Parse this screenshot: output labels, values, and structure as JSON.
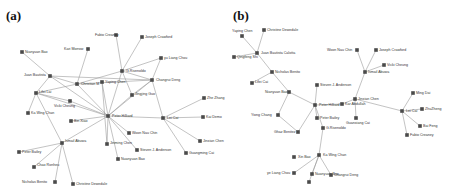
{
  "panels": [
    {
      "id": "a",
      "label": "(a)",
      "nodes": [
        {
          "id": "Fabio Creaney",
          "x": 116,
          "y": 35,
          "lx": -21,
          "ly": 1
        },
        {
          "id": "Joseph Crawford",
          "x": 142,
          "y": 37,
          "lx": 3,
          "ly": 1
        },
        {
          "id": "Kari Morrow",
          "x": 88,
          "y": 49,
          "lx": -24,
          "ly": 1
        },
        {
          "id": "Nianyuan Bao",
          "x": 22,
          "y": 52,
          "lx": 3,
          "ly": 1
        },
        {
          "id": "yu Liang Chou",
          "x": 161,
          "y": 58,
          "lx": 3,
          "ly": 1
        },
        {
          "id": "G.Rivenoldo",
          "x": 122,
          "y": 71,
          "lx": 4,
          "ly": 1
        },
        {
          "id": "Juan Bautista",
          "x": 50,
          "y": 76,
          "lx": -26,
          "ly": 0
        },
        {
          "id": "Christian M",
          "x": 77,
          "y": 84,
          "lx": 4,
          "ly": 1
        },
        {
          "id": "Yaping Chen",
          "x": 102,
          "y": 82,
          "lx": 3,
          "ly": 1
        },
        {
          "id": "Changrui Deng",
          "x": 152,
          "y": 80,
          "lx": 4,
          "ly": 1
        },
        {
          "id": "Lifei Lai",
          "x": 36,
          "y": 93,
          "lx": 3,
          "ly": 0
        },
        {
          "id": "Jingjing Guo",
          "x": 132,
          "y": 95,
          "lx": 3,
          "ly": 0
        },
        {
          "id": "Vicki Cheung",
          "x": 70,
          "y": 101,
          "lx": -16,
          "ly": 6
        },
        {
          "id": "Zhe Zhang",
          "x": 204,
          "y": 98,
          "lx": 3,
          "ly": 1
        },
        {
          "id": "Ka Wing Chan",
          "x": 28,
          "y": 113,
          "lx": 3,
          "ly": 1
        },
        {
          "id": "Bin Xiao",
          "x": 71,
          "y": 121,
          "lx": 3,
          "ly": 1
        },
        {
          "id": "Peter Hilliard",
          "x": 108,
          "y": 116,
          "lx": 4,
          "ly": 1
        },
        {
          "id": "Lei Cai",
          "x": 163,
          "y": 118,
          "lx": 4,
          "ly": 1
        },
        {
          "id": "Kai Demo",
          "x": 203,
          "y": 117,
          "lx": 3,
          "ly": 1
        },
        {
          "id": "Woon Nau Chin",
          "x": 129,
          "y": 133,
          "lx": 3,
          "ly": 1
        },
        {
          "id": "Jinming Chen",
          "x": 107,
          "y": 144,
          "lx": 3,
          "ly": 0
        },
        {
          "id": "Ismail Abuwa",
          "x": 62,
          "y": 143,
          "lx": 3,
          "ly": -1
        },
        {
          "id": "Jinxian Chen",
          "x": 200,
          "y": 141,
          "lx": 3,
          "ly": 1
        },
        {
          "id": "Steven J. Anderson",
          "x": 137,
          "y": 150,
          "lx": 3,
          "ly": 1
        },
        {
          "id": "Peter Bailey",
          "x": 19,
          "y": 152,
          "lx": 3,
          "ly": 1
        },
        {
          "id": "Guangming Cai",
          "x": 186,
          "y": 153,
          "lx": 3,
          "ly": 1
        },
        {
          "id": "Nuanyuan Bao",
          "x": 118,
          "y": 159,
          "lx": 3,
          "ly": 1
        },
        {
          "id": "Chao Ronheu",
          "x": 34,
          "y": 167,
          "lx": 3,
          "ly": -1
        },
        {
          "id": "Nicholas Benito",
          "x": 55,
          "y": 182,
          "lx": -33,
          "ly": 1
        },
        {
          "id": "Christine Dewedale",
          "x": 73,
          "y": 184,
          "lx": 3,
          "ly": 1
        }
      ],
      "edges": [
        [
          "Fabio Creaney",
          "G.Rivenoldo"
        ],
        [
          "Joseph Crawford",
          "G.Rivenoldo"
        ],
        [
          "yu Liang Chou",
          "G.Rivenoldo"
        ],
        [
          "yu Liang Chou",
          "Changrui Deng"
        ],
        [
          "G.Rivenoldo",
          "Changrui Deng"
        ],
        [
          "G.Rivenoldo",
          "Christian M"
        ],
        [
          "G.Rivenoldo",
          "Peter Hilliard"
        ],
        [
          "G.Rivenoldo",
          "Jingjing Guo"
        ],
        [
          "Kari Morrow",
          "Christian M"
        ],
        [
          "Nianyuan Bao",
          "Juan Bautista"
        ],
        [
          "Juan Bautista",
          "Changrui Deng"
        ],
        [
          "Juan Bautista",
          "Christian M"
        ],
        [
          "Juan Bautista",
          "Lifei Lai"
        ],
        [
          "Juan Bautista",
          "Peter Hilliard"
        ],
        [
          "Christian M",
          "Lifei Lai"
        ],
        [
          "Christian M",
          "Peter Hilliard"
        ],
        [
          "Christian M",
          "Changrui Deng"
        ],
        [
          "Yaping Chen",
          "Peter Hilliard"
        ],
        [
          "Yaping Chen",
          "Jinming Chen"
        ],
        [
          "Changrui Deng",
          "Jingjing Guo"
        ],
        [
          "Changrui Deng",
          "Peter Hilliard"
        ],
        [
          "Changrui Deng",
          "Lei Cai"
        ],
        [
          "Lifei Lai",
          "Vicki Cheung"
        ],
        [
          "Lifei Lai",
          "Ka Wing Chan"
        ],
        [
          "Lifei Lai",
          "Peter Hilliard"
        ],
        [
          "Lifei Lai",
          "Ismail Abuwa"
        ],
        [
          "Vicki Cheung",
          "Peter Hilliard"
        ],
        [
          "Bin Xiao",
          "Peter Hilliard"
        ],
        [
          "Jingjing Guo",
          "Peter Hilliard"
        ],
        [
          "Peter Hilliard",
          "Lei Cai"
        ],
        [
          "Peter Hilliard",
          "Woon Nau Chin"
        ],
        [
          "Peter Hilliard",
          "Jinming Chen"
        ],
        [
          "Peter Hilliard",
          "Steven J. Anderson"
        ],
        [
          "Peter Hilliard",
          "Nuanyuan Bao"
        ],
        [
          "Peter Hilliard",
          "Ismail Abuwa"
        ],
        [
          "Lei Cai",
          "Zhe Zhang"
        ],
        [
          "Lei Cai",
          "Kai Demo"
        ],
        [
          "Lei Cai",
          "Jinxian Chen"
        ],
        [
          "Lei Cai",
          "Guangming Cai"
        ],
        [
          "Ismail Abuwa",
          "Peter Bailey"
        ],
        [
          "Ismail Abuwa",
          "Chao Ronheu"
        ],
        [
          "Ismail Abuwa",
          "Nicholas Benito"
        ],
        [
          "Ismail Abuwa",
          "Christine Dewedale"
        ]
      ]
    },
    {
      "id": "b",
      "label": "(b)",
      "nodes": [
        {
          "id": "Yaping Chen",
          "x": 10,
          "y": 36,
          "lx": -10,
          "ly": -4
        },
        {
          "id": "Christine Dewedale",
          "x": 32,
          "y": 30,
          "lx": 3,
          "ly": 1
        },
        {
          "id": "Juan Bautista Calotta",
          "x": 25,
          "y": 53,
          "lx": 4,
          "ly": 1
        },
        {
          "id": "Qingfeng Shi",
          "x": 2,
          "y": 57,
          "lx": 3,
          "ly": 1
        },
        {
          "id": "Nicholas Benito",
          "x": 40,
          "y": 72,
          "lx": 3,
          "ly": 1
        },
        {
          "id": "Lifei Cai",
          "x": 20,
          "y": 83,
          "lx": 3,
          "ly": 0
        },
        {
          "id": "Nianyuan Bao",
          "x": 57,
          "y": 92,
          "lx": -24,
          "ly": 1
        },
        {
          "id": "Steven J. Anderson",
          "x": 85,
          "y": 85,
          "lx": 3,
          "ly": 1
        },
        {
          "id": "Peter Hilliard",
          "x": 83,
          "y": 105,
          "lx": 4,
          "ly": 1
        },
        {
          "id": "Kar Abdullah",
          "x": 110,
          "y": 104,
          "lx": 3,
          "ly": 1
        },
        {
          "id": "Yiong Chang",
          "x": 46,
          "y": 115,
          "lx": -27,
          "ly": 1
        },
        {
          "id": "Peter Bailey",
          "x": 85,
          "y": 118,
          "lx": 3,
          "ly": 1
        },
        {
          "id": "G.Rivenoldo",
          "x": 91,
          "y": 128,
          "lx": 3,
          "ly": 1
        },
        {
          "id": "Ghaz Benitez",
          "x": 66,
          "y": 132,
          "lx": -24,
          "ly": 1
        },
        {
          "id": "Ka Wing Chan",
          "x": 87,
          "y": 155,
          "lx": 4,
          "ly": 1
        },
        {
          "id": "Xin Bao",
          "x": 62,
          "y": 157,
          "lx": 4,
          "ly": 1
        },
        {
          "id": "ye Liang Chou",
          "x": 62,
          "y": 173,
          "lx": -27,
          "ly": 1
        },
        {
          "id": "Nuanyuan Bao",
          "x": 80,
          "y": 174,
          "lx": 3,
          "ly": 1
        },
        {
          "id": "Changrui Deng",
          "x": 99,
          "y": 175,
          "lx": 3,
          "ly": 1
        },
        {
          "id": "Peter Node",
          "x": 77,
          "y": 182,
          "lx": 0,
          "ly": 0,
          "hideLabel": true
        },
        {
          "id": "Woon Nau Chin",
          "x": 125,
          "y": 50,
          "lx": -30,
          "ly": 1
        },
        {
          "id": "Joseph Crawford",
          "x": 144,
          "y": 50,
          "lx": 3,
          "ly": 1
        },
        {
          "id": "Vicki Cheung",
          "x": 152,
          "y": 65,
          "lx": 3,
          "ly": 1
        },
        {
          "id": "Ismail Abuwa",
          "x": 133,
          "y": 72,
          "lx": 3,
          "ly": 1
        },
        {
          "id": "Jinxian Chen",
          "x": 123,
          "y": 99,
          "lx": 3,
          "ly": 1
        },
        {
          "id": "Guanxiang Cai",
          "x": 124,
          "y": 118,
          "lx": -10,
          "ly": 6
        },
        {
          "id": "Ming Dai",
          "x": 181,
          "y": 93,
          "lx": 3,
          "ly": 1
        },
        {
          "id": "Lei Cai",
          "x": 170,
          "y": 111,
          "lx": 4,
          "ly": 1
        },
        {
          "id": "ZhuZheng",
          "x": 190,
          "y": 109,
          "lx": 3,
          "ly": 1
        },
        {
          "id": "Bai Feng",
          "x": 188,
          "y": 126,
          "lx": 3,
          "ly": 1
        },
        {
          "id": "Fabio Creaney",
          "x": 175,
          "y": 135,
          "lx": 3,
          "ly": 1
        }
      ],
      "edges": [
        [
          "Yaping Chen",
          "Juan Bautista Calotta"
        ],
        [
          "Christine Dewedale",
          "Juan Bautista Calotta"
        ],
        [
          "Qingfeng Shi",
          "Juan Bautista Calotta"
        ],
        [
          "Juan Bautista Calotta",
          "Nicholas Benito"
        ],
        [
          "Nicholas Benito",
          "Lifei Cai"
        ],
        [
          "Nicholas Benito",
          "Nianyuan Bao"
        ],
        [
          "Nianyuan Bao",
          "Peter Hilliard"
        ],
        [
          "Nianyuan Bao",
          "Yiong Chang"
        ],
        [
          "Yiong Chang",
          "Ghaz Benitez"
        ],
        [
          "Ghaz Benitez",
          "Peter Hilliard"
        ],
        [
          "Steven J. Anderson",
          "Peter Hilliard"
        ],
        [
          "Peter Hilliard",
          "Kar Abdullah"
        ],
        [
          "Peter Hilliard",
          "Peter Bailey"
        ],
        [
          "Peter Hilliard",
          "G.Rivenoldo"
        ],
        [
          "Kar Abdullah",
          "Jinxian Chen"
        ],
        [
          "G.Rivenoldo",
          "Ka Wing Chan"
        ],
        [
          "Ka Wing Chan",
          "ye Liang Chou"
        ],
        [
          "Ka Wing Chan",
          "Nuanyuan Bao"
        ],
        [
          "Ka Wing Chan",
          "Changrui Deng"
        ],
        [
          "Ka Wing Chan",
          "Peter Node"
        ],
        [
          "Woon Nau Chin",
          "Ismail Abuwa"
        ],
        [
          "Joseph Crawford",
          "Ismail Abuwa"
        ],
        [
          "Vicki Cheung",
          "Ismail Abuwa"
        ],
        [
          "Ismail Abuwa",
          "Jinxian Chen"
        ],
        [
          "Jinxian Chen",
          "Guanxiang Cai"
        ],
        [
          "Jinxian Chen",
          "Lei Cai"
        ],
        [
          "Lei Cai",
          "Ming Dai"
        ],
        [
          "Lei Cai",
          "ZhuZheng"
        ],
        [
          "Lei Cai",
          "Bai Feng"
        ],
        [
          "Lei Cai",
          "Fabio Creaney"
        ]
      ]
    }
  ]
}
